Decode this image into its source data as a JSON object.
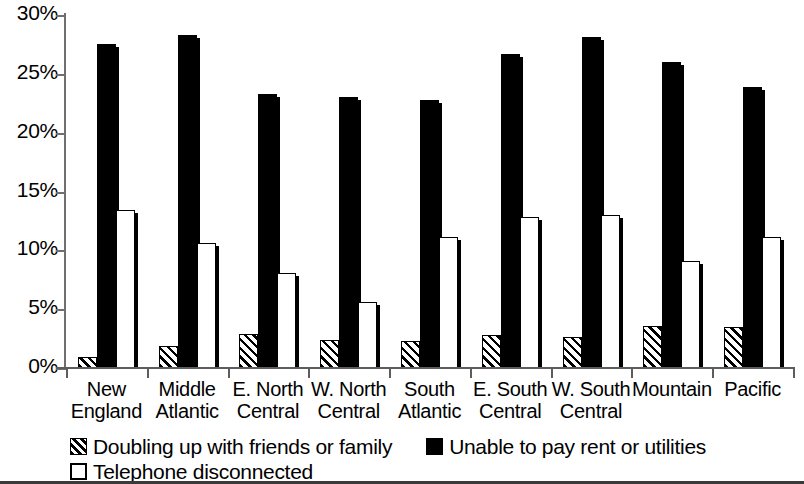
{
  "chart_data": {
    "type": "bar",
    "title": "",
    "xlabel": "",
    "ylabel": "",
    "ylim": [
      0,
      30
    ],
    "yticks": [
      0,
      5,
      10,
      15,
      20,
      25,
      30
    ],
    "ytick_labels": [
      "0%",
      "5%",
      "10%",
      "15%",
      "20%",
      "25%",
      "30%"
    ],
    "grid": false,
    "legend_position": "bottom-left",
    "categories": [
      "New England",
      "Middle Atlantic",
      "E. North Central",
      "W. North Central",
      "South Atlantic",
      "E. South Central",
      "W. South Central",
      "Mountain",
      "Pacific"
    ],
    "category_lines": [
      [
        "New",
        "England"
      ],
      [
        "Middle",
        "Atlantic"
      ],
      [
        "E. North",
        "Central"
      ],
      [
        "W. North",
        "Central"
      ],
      [
        "South",
        "Atlantic"
      ],
      [
        "E. South",
        "Central"
      ],
      [
        "W. South",
        "Central"
      ],
      [
        "Mountain",
        ""
      ],
      [
        "Pacific",
        ""
      ]
    ],
    "series": [
      {
        "name": "Doubling up with friends or family",
        "style": "hatched",
        "color": "#000000",
        "values": [
          0.9,
          1.9,
          2.9,
          2.4,
          2.3,
          2.8,
          2.6,
          3.6,
          3.5
        ]
      },
      {
        "name": "Unable to pay rent or utilities",
        "style": "solid",
        "color": "#000000",
        "values": [
          27.5,
          28.3,
          23.3,
          23.0,
          22.8,
          26.7,
          28.1,
          26.0,
          23.9
        ]
      },
      {
        "name": "Telephone disconnected",
        "style": "open",
        "color": "#ffffff",
        "values": [
          13.4,
          10.6,
          8.1,
          5.6,
          11.1,
          12.8,
          13.0,
          9.1,
          11.1
        ]
      }
    ]
  },
  "legend": {
    "items": [
      {
        "label": "Doubling up with friends or family",
        "swatch": "hatched-square-icon"
      },
      {
        "label": "Unable to pay rent or utilities",
        "swatch": "filled-square-icon"
      },
      {
        "label": "Telephone disconnected",
        "swatch": "open-square-icon"
      }
    ]
  },
  "axis": {
    "y_tick_labels": [
      "30%",
      "25%",
      "20%",
      "15%",
      "10%",
      "5%",
      "0%"
    ]
  }
}
